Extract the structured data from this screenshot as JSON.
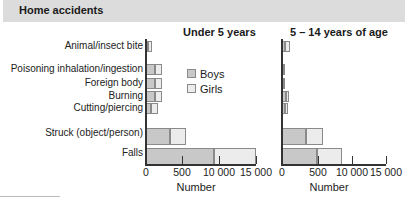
{
  "header": {
    "title": "Home accidents"
  },
  "legend": {
    "boys": "Boys",
    "girls": "Girls"
  },
  "colors": {
    "boys": "#c8c8c8",
    "girls": "#ececec",
    "header_bg": "#dcdcdc",
    "border": "#8a8a8a"
  },
  "chart_data": [
    {
      "type": "bar",
      "orientation": "horizontal",
      "stacked": true,
      "title": "Under 5 years",
      "xlabel": "Number",
      "ylabel": "",
      "xscale": "piecewise (0–500, 500–10000, 10000–15000 equally spaced)",
      "xticks": [
        0,
        500,
        10000,
        15000
      ],
      "xtick_labels": [
        "0",
        "500",
        "10 000",
        "15 000"
      ],
      "xlim": [
        0,
        15000
      ],
      "categories": [
        "Animal/insect bite",
        "Poisoning inhalation/ingestion",
        "Foreign body",
        "Burning",
        "Cutting/piercing",
        "Struck (object/person)",
        "Falls"
      ],
      "series": [
        {
          "name": "Boys",
          "values": [
            30,
            125,
            125,
            125,
            70,
            330,
            8700
          ]
        },
        {
          "name": "Girls",
          "values": [
            50,
            95,
            95,
            95,
            95,
            1170,
            6300
          ]
        }
      ],
      "legend_position": "inside-right",
      "grid": false
    },
    {
      "type": "bar",
      "orientation": "horizontal",
      "stacked": true,
      "title": "5 – 14 years of age",
      "xlabel": "Number",
      "ylabel": "",
      "xscale": "piecewise (0–500, 500–10000, 10000–15000 equally spaced)",
      "xticks": [
        0,
        500,
        10000,
        15000
      ],
      "xtick_labels": [
        "0",
        "500",
        "10 000",
        "15 000"
      ],
      "xlim": [
        0,
        15000
      ],
      "categories": [
        "Animal/insect bite",
        "Poisoning inhalation/ingestion",
        "Foreign body",
        "Burning",
        "Cutting/piercing",
        "Struck (object/person)",
        "Falls"
      ],
      "series": [
        {
          "name": "Boys",
          "values": [
            40,
            15,
            15,
            55,
            40,
            330,
            490
          ]
        },
        {
          "name": "Girls",
          "values": [
            70,
            10,
            10,
            45,
            45,
            1570,
            6810
          ]
        }
      ],
      "grid": false
    }
  ]
}
